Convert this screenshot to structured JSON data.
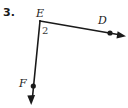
{
  "figure": {
    "problem_number": "3.",
    "background_color": "#ffffff",
    "stroke_color": "#1a1a1a",
    "label_color": "#1a1a1a",
    "angle_label_color": "#3a3a3a",
    "vertex_label": "E",
    "angle_label": "2",
    "ray_end_labels": {
      "right": "D",
      "down": "F"
    },
    "points": {
      "E": {
        "x": 40,
        "y": 21
      },
      "D": {
        "x": 110,
        "y": 33
      },
      "F": {
        "x": 33,
        "y": 86
      }
    },
    "rays": [
      {
        "name": "ray-ED",
        "from": "E",
        "through": "D",
        "arrow_tip": {
          "x": 126,
          "y": 36
        },
        "has_arrowhead": true,
        "dot_at": "D"
      },
      {
        "name": "ray-EF",
        "from": "E",
        "through": "F",
        "arrow_tip": {
          "x": 31,
          "y": 105
        },
        "has_arrowhead": true,
        "dot_at": "F"
      }
    ]
  }
}
